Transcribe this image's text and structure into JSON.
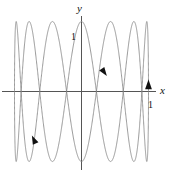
{
  "figure": {
    "background_color": "#ffffff",
    "curve_color": "#808080",
    "axis_color": "#555555",
    "arrow_color": "#111111",
    "text_color": "#111111"
  },
  "labels": {
    "y_axis": "y",
    "x_axis": "x",
    "y_tick_one": "1",
    "x_tick_one": "1"
  },
  "chart_data": {
    "type": "line",
    "title": "",
    "subtitle": "",
    "xlabel": "x",
    "ylabel": "y",
    "xlim": [
      -1.15,
      1.15
    ],
    "ylim": [
      -1.25,
      1.25
    ],
    "xticks": [
      1
    ],
    "xticklabels": [
      "1"
    ],
    "yticks": [
      1
    ],
    "yticklabels": [
      "1"
    ],
    "grid": false,
    "legend": null,
    "parametric": {
      "description": "Lissajous figure x = sin(t), y = cos(7t)",
      "x_expression": "sin(t)",
      "y_expression": "cos(7*t)",
      "x_frequency": 1,
      "y_frequency": 7,
      "phase": 0,
      "t_range": [
        0,
        6.283185307179586
      ],
      "amplitude_x": 1,
      "amplitude_y": 1
    },
    "annotations": [
      {
        "name": "direction-arrow-right",
        "x": 1.0,
        "y": 0.05,
        "rotation_deg": -90,
        "note": "arrowhead pointing up at right edge"
      },
      {
        "name": "direction-arrow-middle",
        "x": 0.27,
        "y": 0.42,
        "rotation_deg": 35,
        "note": "arrowhead pointing down-right"
      },
      {
        "name": "direction-arrow-lower-left",
        "x": -0.62,
        "y": -0.72,
        "rotation_deg": 205,
        "note": "arrowhead pointing up-left"
      }
    ]
  }
}
